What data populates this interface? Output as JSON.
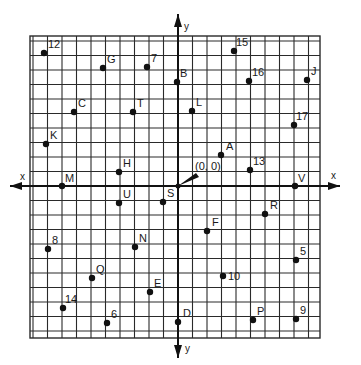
{
  "diagram": {
    "origin_label": "(0, 0)",
    "axes": {
      "x_positive_label": "x",
      "x_negative_label": "x",
      "y_positive_label": "y",
      "y_negative_label": "y"
    },
    "colors": {
      "grid": "#2a2a2a",
      "point": "#111111",
      "background": "#ffffff"
    },
    "grid": {
      "left": 30,
      "right": 320,
      "top": 36,
      "bottom": 338,
      "origin_px": [
        178,
        186
      ],
      "spacing": 14.5
    },
    "points": [
      {
        "label": "12",
        "px": [
          44,
          53
        ],
        "lx": 4,
        "ly": -5
      },
      {
        "label": "G",
        "px": [
          103,
          68
        ],
        "lx": 4,
        "ly": -5
      },
      {
        "label": "7",
        "px": [
          147,
          67
        ],
        "lx": 4,
        "ly": -5
      },
      {
        "label": "15",
        "px": [
          234,
          51
        ],
        "lx": 2,
        "ly": -5
      },
      {
        "label": "B",
        "px": [
          177,
          82
        ],
        "lx": 3,
        "ly": -5
      },
      {
        "label": "16",
        "px": [
          249,
          81
        ],
        "lx": 3,
        "ly": -5
      },
      {
        "label": "J",
        "px": [
          307,
          80
        ],
        "lx": 4,
        "ly": -5
      },
      {
        "label": "C",
        "px": [
          74,
          112
        ],
        "lx": 4,
        "ly": -5
      },
      {
        "label": "T",
        "px": [
          133,
          112
        ],
        "lx": 4,
        "ly": -5
      },
      {
        "label": "L",
        "px": [
          192,
          111
        ],
        "lx": 4,
        "ly": -5
      },
      {
        "label": "17",
        "px": [
          294,
          125
        ],
        "lx": 2,
        "ly": -5
      },
      {
        "label": "K",
        "px": [
          46,
          144
        ],
        "lx": 4,
        "ly": -5
      },
      {
        "label": "A",
        "px": [
          221,
          155
        ],
        "lx": 5,
        "ly": -5
      },
      {
        "label": "13",
        "px": [
          250,
          170
        ],
        "lx": 3,
        "ly": -5
      },
      {
        "label": "H",
        "px": [
          119,
          172
        ],
        "lx": 4,
        "ly": -5
      },
      {
        "label": "M",
        "px": [
          62,
          186
        ],
        "lx": 3,
        "ly": -4
      },
      {
        "label": "V",
        "px": [
          295,
          186
        ],
        "lx": 3,
        "ly": -4
      },
      {
        "label": "U",
        "px": [
          119,
          203
        ],
        "lx": 4,
        "ly": -5
      },
      {
        "label": "S",
        "px": [
          163,
          202
        ],
        "lx": 4,
        "ly": -5
      },
      {
        "label": "F",
        "px": [
          207,
          231
        ],
        "lx": 5,
        "ly": -5
      },
      {
        "label": "R",
        "px": [
          265,
          214
        ],
        "lx": 5,
        "ly": -5
      },
      {
        "label": "8",
        "px": [
          48,
          249
        ],
        "lx": 4,
        "ly": -5
      },
      {
        "label": "N",
        "px": [
          135,
          247
        ],
        "lx": 4,
        "ly": -5
      },
      {
        "label": "5",
        "px": [
          296,
          260
        ],
        "lx": 4,
        "ly": -5
      },
      {
        "label": "Q",
        "px": [
          92,
          278
        ],
        "lx": 4,
        "ly": -5
      },
      {
        "label": "10",
        "px": [
          223,
          276
        ],
        "lx": 5,
        "ly": 4
      },
      {
        "label": "E",
        "px": [
          150,
          292
        ],
        "lx": 4,
        "ly": -5
      },
      {
        "label": "14",
        "px": [
          63,
          308
        ],
        "lx": 2,
        "ly": -5
      },
      {
        "label": "6",
        "px": [
          107,
          323
        ],
        "lx": 4,
        "ly": -5
      },
      {
        "label": "D",
        "px": [
          178,
          322
        ],
        "lx": 5,
        "ly": -5
      },
      {
        "label": "P",
        "px": [
          253,
          320
        ],
        "lx": 4,
        "ly": -5
      },
      {
        "label": "9",
        "px": [
          296,
          319
        ],
        "lx": 4,
        "ly": -5
      }
    ]
  }
}
